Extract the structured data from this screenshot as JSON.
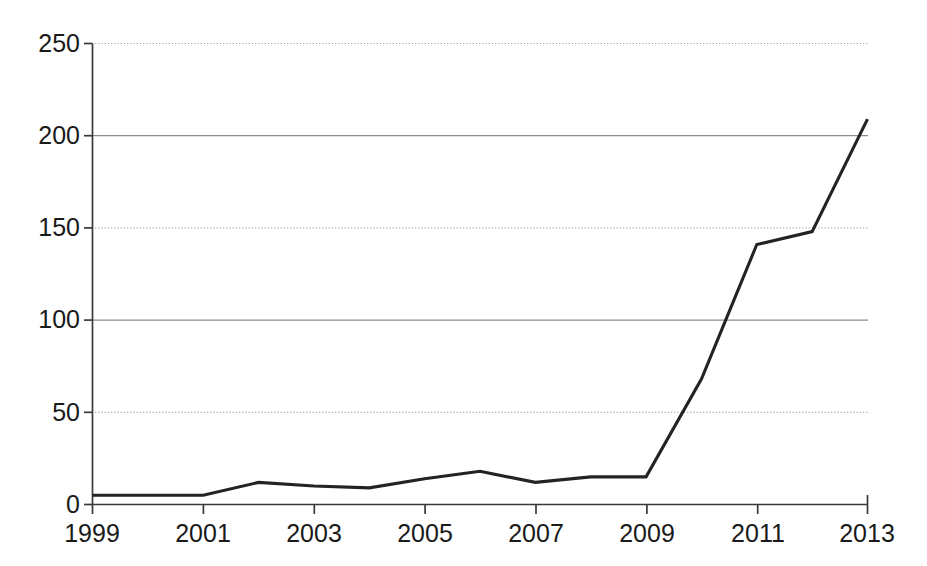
{
  "chart_data": {
    "type": "line",
    "title": "",
    "subtitle": "",
    "xlabel": "",
    "ylabel": "",
    "x": [
      1999,
      2000,
      2001,
      2002,
      2003,
      2004,
      2005,
      2006,
      2007,
      2008,
      2009,
      2010,
      2011,
      2012,
      2013
    ],
    "values": [
      5,
      5,
      5,
      12,
      10,
      9,
      14,
      18,
      12,
      15,
      15,
      68,
      141,
      148,
      209
    ],
    "series": [
      {
        "name": "count",
        "values": [
          5,
          5,
          5,
          12,
          10,
          9,
          14,
          18,
          12,
          15,
          15,
          68,
          141,
          148,
          209
        ],
        "color": "#232323"
      }
    ],
    "xlim": [
      1999,
      2013
    ],
    "ylim": [
      0,
      250
    ],
    "x_ticks": [
      1999,
      2001,
      2003,
      2005,
      2007,
      2009,
      2011,
      2013
    ],
    "x_tick_labels": [
      "1999",
      "2001",
      "2003",
      "2005",
      "2007",
      "2009",
      "2011",
      "2013"
    ],
    "y_ticks": [
      0,
      50,
      100,
      150,
      200,
      250
    ],
    "y_tick_labels": [
      "0",
      "50",
      "100",
      "150",
      "200",
      "250"
    ],
    "grid": "horizontal",
    "legend": "none",
    "annotations": []
  },
  "axes": {
    "y_axis_label_0": "0",
    "y_axis_label_1": "50",
    "y_axis_label_2": "100",
    "y_axis_label_3": "150",
    "y_axis_label_4": "200",
    "y_axis_label_5": "250",
    "x_axis_label_0": "1999",
    "x_axis_label_1": "2001",
    "x_axis_label_2": "2003",
    "x_axis_label_3": "2005",
    "x_axis_label_4": "2007",
    "x_axis_label_5": "2009",
    "x_axis_label_6": "2011",
    "x_axis_label_7": "2013"
  },
  "colors": {
    "line": "#232323",
    "axis": "#3a3a3a",
    "grid_solid": "#8c8c8c",
    "grid_dotted": "#9a9a9a",
    "background": "#ffffff"
  }
}
